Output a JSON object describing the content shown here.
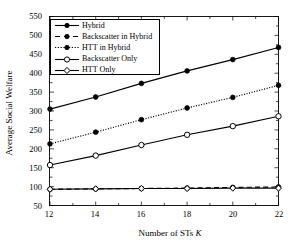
{
  "chart_data": {
    "type": "line",
    "title": "",
    "xlabel": "Number of STs K",
    "xlabel_plain": "Number of STs ",
    "xlabel_italic": "K",
    "ylabel": "Average Social Welfare",
    "x": [
      12,
      14,
      16,
      18,
      20,
      22
    ],
    "xlim": [
      12,
      22
    ],
    "ylim": [
      50,
      550
    ],
    "xticks": [
      "12",
      "14",
      "16",
      "18",
      "20",
      "22"
    ],
    "yticks": [
      "50",
      "100",
      "150",
      "200",
      "250",
      "300",
      "350",
      "400",
      "450",
      "500",
      "550"
    ],
    "grid": false,
    "legend_position": "upper-left",
    "series": [
      {
        "name": "Hybrid",
        "values": [
          305,
          337,
          373,
          406,
          436,
          468
        ],
        "line_style": "solid",
        "marker": "filled-circle",
        "color": "#000000"
      },
      {
        "name": "Backscatter in Hybrid",
        "values": [
          93,
          94,
          95,
          96,
          98,
          99
        ],
        "line_style": "dashed",
        "marker": "filled-circle",
        "color": "#000000"
      },
      {
        "name": "HTT in Hybrid",
        "values": [
          213,
          244,
          277,
          308,
          336,
          368
        ],
        "line_style": "dotted",
        "marker": "filled-circle",
        "color": "#000000"
      },
      {
        "name": "Backscatter Only",
        "values": [
          157,
          182,
          210,
          237,
          260,
          286
        ],
        "line_style": "solid",
        "marker": "open-circle",
        "color": "#000000"
      },
      {
        "name": "HTT Only",
        "values": [
          93,
          94,
          95,
          95,
          96,
          96
        ],
        "line_style": "solid",
        "marker": "open-diamond",
        "color": "#000000"
      }
    ]
  },
  "axes": {
    "ylabel": "Average Social Welfare",
    "xlabel_plain": "Number of STs ",
    "xlabel_italic": "K",
    "yticks": [
      "550",
      "500",
      "450",
      "400",
      "350",
      "300",
      "250",
      "200",
      "150",
      "100",
      "50"
    ],
    "xticks": [
      "12",
      "14",
      "16",
      "18",
      "20",
      "22"
    ]
  },
  "legend": {
    "items": [
      {
        "label": "Hybrid"
      },
      {
        "label": "Backscatter in Hybrid"
      },
      {
        "label": "HTT in Hybrid"
      },
      {
        "label": "Backscatter Only"
      },
      {
        "label": "HTT Only"
      }
    ]
  }
}
